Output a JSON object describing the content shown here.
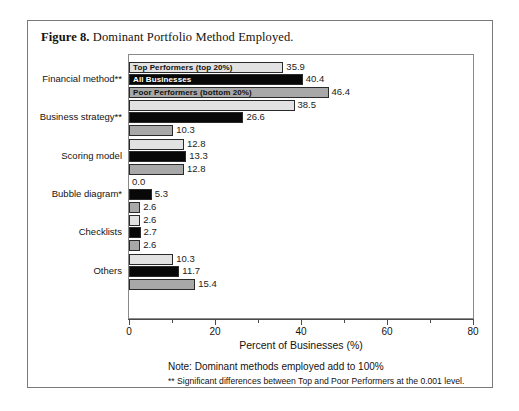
{
  "figure": {
    "label": "Figure 8.",
    "caption": "Dominant Portfolio Method Employed."
  },
  "footnotes": {
    "note": "Note: Dominant methods employed add to 100%",
    "significance": "** Significant differences between Top and Poor Performers at the 0.001 level."
  },
  "chart_data": {
    "type": "bar",
    "orientation": "horizontal",
    "title": "Dominant Portfolio Method Employed.",
    "xlabel": "Percent of Businesses (%)",
    "ylabel": "",
    "xlim": [
      0,
      80
    ],
    "xticks": [
      0,
      20,
      40,
      60,
      80
    ],
    "xtick_labels": [
      "0",
      "20",
      "40",
      "60",
      "80"
    ],
    "xminor_ticks": [
      10,
      30,
      50,
      70
    ],
    "grid": false,
    "legend_position": "inside-first-group",
    "categories": [
      "Financial method**",
      "Business strategy**",
      "Scoring model",
      "Bubble diagram*",
      "Checklists",
      "Others"
    ],
    "series": [
      {
        "name": "Top Performers (top 20%)",
        "color": "#e2e2e2",
        "values": [
          35.9,
          38.5,
          12.8,
          0.0,
          2.6,
          10.3
        ],
        "labels": [
          "35.9",
          "38.5",
          "12.8",
          "0.0",
          "2.6",
          "10.3"
        ]
      },
      {
        "name": "All Businesses",
        "color": "#080808",
        "values": [
          40.4,
          26.6,
          13.3,
          5.3,
          2.7,
          11.7
        ],
        "labels": [
          "40.4",
          "26.6",
          "13.3",
          "5.3",
          "2.7",
          "11.7"
        ]
      },
      {
        "name": "Poor Performers (bottom 20%)",
        "color": "#a8a8a8",
        "values": [
          46.4,
          10.3,
          12.8,
          2.6,
          2.6,
          15.4
        ],
        "labels": [
          "46.4",
          "10.3",
          "12.8",
          "2.6",
          "2.6",
          "15.4"
        ]
      }
    ]
  }
}
